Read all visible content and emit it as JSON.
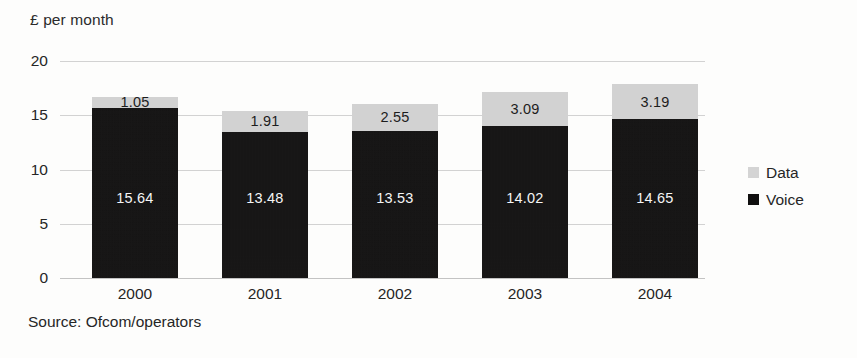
{
  "chart_data": {
    "type": "bar",
    "subtype": "stacked-column",
    "title": "",
    "ylabel": "£ per month",
    "xlabel": "",
    "categories": [
      "2000",
      "2001",
      "2002",
      "2003",
      "2004"
    ],
    "series": [
      {
        "name": "Voice",
        "color": "#100f0f",
        "values": [
          15.64,
          13.48,
          13.53,
          14.02,
          14.65
        ],
        "labels": [
          "15.64",
          "13.48",
          "13.53",
          "14.02",
          "14.65"
        ]
      },
      {
        "name": "Data",
        "color": "#d4d4d4",
        "values": [
          1.05,
          1.91,
          2.55,
          3.09,
          3.19
        ],
        "labels": [
          "1.05",
          "1.91",
          "2.55",
          "3.09",
          "3.19"
        ]
      }
    ],
    "totals": [
      16.69,
      15.39,
      16.08,
      17.11,
      17.84
    ],
    "ylim": [
      0,
      20
    ],
    "yticks": [
      0,
      5,
      10,
      15,
      20
    ],
    "ytick_labels": [
      "0",
      "5",
      "10",
      "15",
      "20"
    ],
    "grid": true,
    "legend_position": "right",
    "source": "Source: Ofcom/operators"
  },
  "axis": {
    "y_title": "£ per month",
    "ytick_labels": [
      "20",
      "15",
      "10",
      "5",
      "0"
    ],
    "xtick_labels": [
      "2000",
      "2001",
      "2002",
      "2003",
      "2004"
    ]
  },
  "legend": {
    "items": [
      {
        "label": "Data",
        "color": "#d4d4d4"
      },
      {
        "label": "Voice",
        "color": "#100f0f"
      }
    ]
  },
  "footer": {
    "source": "Source: Ofcom/operators"
  }
}
